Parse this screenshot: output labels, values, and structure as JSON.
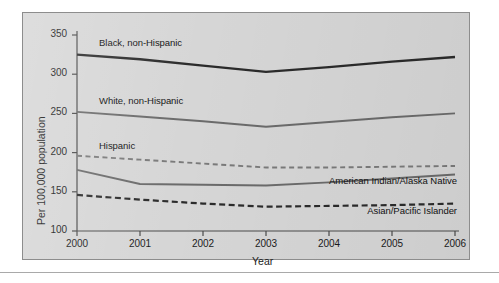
{
  "chart_data": {
    "type": "line",
    "title": "",
    "xlabel": "Year",
    "ylabel": "Per 100,000 population",
    "x": [
      2000,
      2001,
      2002,
      2003,
      2004,
      2005,
      2006
    ],
    "xtick_labels": [
      "2000",
      "2001",
      "2002",
      "2003",
      "2004",
      "2005",
      "2006"
    ],
    "xlim": [
      2000,
      2006
    ],
    "ylim": [
      100,
      350
    ],
    "ytick_labels": [
      "100",
      "150",
      "200",
      "250",
      "300",
      "350"
    ],
    "yticks": [
      100,
      150,
      200,
      250,
      300,
      350
    ],
    "grid": false,
    "legend_position": "inline-annotations",
    "series": [
      {
        "name": "Black, non-Hispanic",
        "values": [
          325,
          319,
          311,
          303,
          309,
          316,
          322
        ],
        "color": "#2b2b2b",
        "style": "solid",
        "width": 2.4,
        "label_x": 2000.35,
        "label_y": 340
      },
      {
        "name": "White, non-Hispanic",
        "values": [
          252,
          246,
          240,
          233,
          239,
          245,
          250
        ],
        "color": "#6b6b6b",
        "style": "solid",
        "width": 1.9,
        "label_x": 2000.35,
        "label_y": 266
      },
      {
        "name": "Hispanic",
        "values": [
          196,
          191,
          186,
          181,
          181,
          182,
          183
        ],
        "color": "#7a7a7a",
        "style": "dashed",
        "width": 1.9,
        "label_x": 2000.35,
        "label_y": 209
      },
      {
        "name": "American Indian/Alaska Native",
        "values": [
          178,
          160,
          159,
          158,
          162,
          167,
          172
        ],
        "color": "#6b6b6b",
        "style": "solid",
        "width": 1.9,
        "label_x": 2003.12,
        "label_y": 164
      },
      {
        "name": "Asian/Pacific Islander",
        "values": [
          146,
          140,
          135,
          131,
          132,
          133,
          135
        ],
        "color": "#2b2b2b",
        "style": "dashed",
        "width": 2.2,
        "label_x": 2003.72,
        "label_y": 126
      }
    ]
  },
  "figure": {
    "background_color": "#d6d6d6",
    "border_color": "#8d8d8d",
    "axis_color": "#4a4a4a"
  }
}
